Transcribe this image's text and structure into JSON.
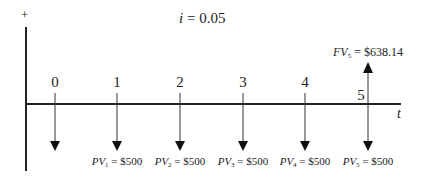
{
  "diagram": {
    "type": "cash-flow-timeline",
    "axis_plus_label": "+",
    "rate": {
      "symbol": "i",
      "equals": " = ",
      "value": "0.05"
    },
    "time_axis_label": "t",
    "periods": [
      "0",
      "1",
      "2",
      "3",
      "4",
      "5"
    ],
    "outflows": [
      {
        "period": "0",
        "label": ""
      },
      {
        "period": "1",
        "prefix": "PV",
        "sub": "1",
        "text": " = $500"
      },
      {
        "period": "2",
        "prefix": "PV",
        "sub": "2",
        "text": " = $500"
      },
      {
        "period": "3",
        "prefix": "PV",
        "sub": "3",
        "text": " = $500"
      },
      {
        "period": "4",
        "prefix": "PV",
        "sub": "4",
        "text": " = $500"
      },
      {
        "period": "5",
        "prefix": "PV",
        "sub": "5",
        "text": " = $500"
      }
    ],
    "inflow": {
      "period": "5",
      "prefix": "FV",
      "sub": "5",
      "text": " = $638.14"
    },
    "colors": {
      "line": "#222222",
      "background": "#ffffff"
    }
  }
}
